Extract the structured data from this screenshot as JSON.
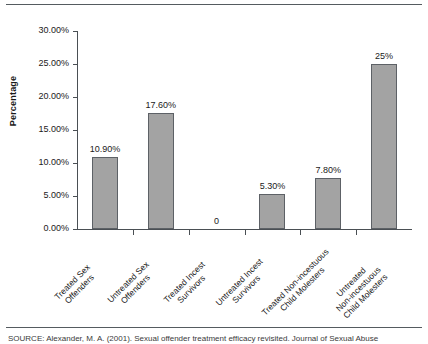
{
  "figure": {
    "top_rule": "",
    "bottom_rule": "",
    "source_note": "SOURCE: Alexander, M. A. (2001). Sexual offender treatment efficacy revisited. Journal of Sexual Abuse"
  },
  "chart_data": {
    "type": "bar",
    "title": "",
    "xlabel": "",
    "ylabel": "Percentage",
    "ylim": [
      0,
      30
    ],
    "ytick_values": [
      0,
      5,
      10,
      15,
      20,
      25,
      30
    ],
    "ytick_labels": [
      "0.00%",
      "5.00%",
      "10.00%",
      "15.00%",
      "20.00%",
      "25.00%",
      "30.00%"
    ],
    "grid": false,
    "legend": false,
    "bar_color": "#a3a3a3",
    "bar_edge_color": "#5d6166",
    "categories": [
      "Treated Sex Offenders",
      "Untreated Sex Offenders",
      "Treated Incest Survivors",
      "Untreated Incest Survivors",
      "Treated Non-incestuous Child Molesters",
      "Untreated Non-incestuous Child Molesters"
    ],
    "category_lines": [
      [
        "Treated Sex",
        "Offenders"
      ],
      [
        "Untreated Sex",
        "Offenders"
      ],
      [
        "Treated Incest",
        "Survivors"
      ],
      [
        "Untreated Incest",
        "Survivors"
      ],
      [
        "Treated Non-incestuous",
        "Child Molesters"
      ],
      [
        "Untreated",
        "Non-incestuous",
        "Child Molesters"
      ]
    ],
    "values": [
      10.9,
      17.6,
      0,
      5.3,
      7.8,
      25
    ],
    "data_labels": [
      "10.90%",
      "17.60%",
      "0",
      "5.30%",
      "7.80%",
      "25%"
    ]
  }
}
